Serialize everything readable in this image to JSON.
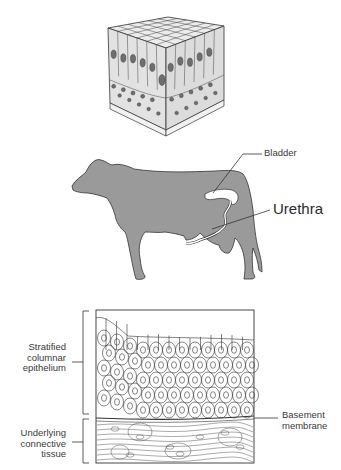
{
  "figure": {
    "panels": [
      {
        "id": "epithelium-cube",
        "description": "3D block of stratified columnar epithelium"
      },
      {
        "id": "cow-silhouette",
        "description": "Cow silhouette showing bladder and urethra"
      },
      {
        "id": "histology-section",
        "description": "Cross-section of stratified columnar epithelium"
      }
    ]
  },
  "labels": {
    "bladder": "Bladder",
    "urethra": "Urethra",
    "epithelium": [
      "Stratified",
      "columnar",
      "epithelium"
    ],
    "connective": [
      "Underlying",
      "connective",
      "tissue"
    ],
    "basement": [
      "Basement",
      "membrane"
    ]
  },
  "colors": {
    "cow_fill": "#9a9a9a",
    "outline": "#333333",
    "nucleus": "#707070",
    "cell_fill": "#e6e6e6"
  }
}
